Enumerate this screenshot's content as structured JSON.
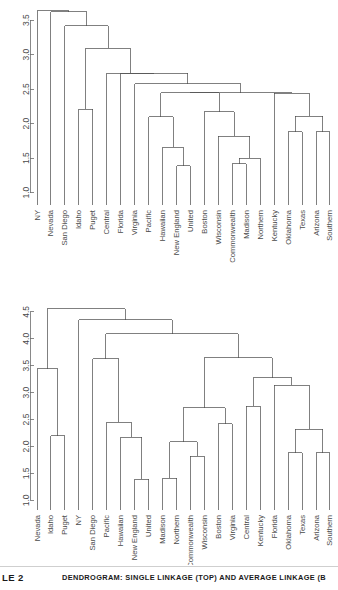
{
  "figure": {
    "caption_number": "LE 2",
    "caption_text": "DENDROGRAM: SINGLE LINKAGE (TOP) AND AVERAGE LINKAGE (B",
    "line_color": "#4a4a4a",
    "axis_color": "#6b6b6b",
    "background": "#ffffff"
  },
  "chart_data": [
    {
      "type": "dendrogram",
      "title": "Single linkage (top panel)",
      "xlabel": "",
      "ylabel": "",
      "ylim": [
        0.82,
        3.72
      ],
      "yticks": [
        1.0,
        1.5,
        2.0,
        2.5,
        3.0,
        3.5
      ],
      "ytick_labels": [
        "1.0",
        "1.5",
        "2.0",
        "2.5",
        "3.0",
        "3.5"
      ],
      "grid": false,
      "legend": "none",
      "leaves": [
        "NY",
        "Nevada",
        "San Diego",
        "Idaho",
        "Puget",
        "Central",
        "Florida",
        "Virginia",
        "Pacific",
        "Hawaiian",
        "New England",
        "United",
        "Boston",
        "Wisconsin",
        "Commonwealth",
        "Madison",
        "Northern",
        "Kentucky",
        "Oklahoma",
        "Texas",
        "Arizona",
        "Southern"
      ],
      "merges": [
        {
          "id": "m1",
          "left": "New England",
          "right": "United",
          "height": 1.39
        },
        {
          "id": "m2",
          "left": "Commonwealth",
          "right": "Madison",
          "height": 1.42
        },
        {
          "id": "m3",
          "left": "m2",
          "right": "Northern",
          "height": 1.5
        },
        {
          "id": "m4",
          "left": "Hawaiian",
          "right": "m1",
          "height": 1.66
        },
        {
          "id": "m5",
          "left": "Wisconsin",
          "right": "m3",
          "height": 1.82
        },
        {
          "id": "m6",
          "left": "Oklahoma",
          "right": "Texas",
          "height": 1.88
        },
        {
          "id": "m7",
          "left": "Arizona",
          "right": "Southern",
          "height": 1.88
        },
        {
          "id": "m8",
          "left": "Pacific",
          "right": "m4",
          "height": 2.1
        },
        {
          "id": "m9",
          "left": "m6",
          "right": "m7",
          "height": 2.11
        },
        {
          "id": "m10",
          "left": "Boston",
          "right": "m5",
          "height": 2.17
        },
        {
          "id": "m11",
          "left": "Idaho",
          "right": "Puget",
          "height": 2.21
        },
        {
          "id": "m12",
          "left": "Kentucky",
          "right": "m9",
          "height": 2.44
        },
        {
          "id": "m13",
          "left": "m8",
          "right": "m10",
          "height": 2.45
        },
        {
          "id": "m14",
          "left": "m13",
          "right": "m12",
          "height": 2.45
        },
        {
          "id": "m15",
          "left": "Virginia",
          "right": "m14",
          "height": 2.58
        },
        {
          "id": "m16",
          "left": "Florida",
          "right": "m15",
          "height": 2.73
        },
        {
          "id": "m17",
          "left": "Central",
          "right": "m16",
          "height": 2.73
        },
        {
          "id": "m18",
          "left": "m11",
          "right": "m17",
          "height": 3.09
        },
        {
          "id": "m19",
          "left": "San Diego",
          "right": "m18",
          "height": 3.42
        },
        {
          "id": "m20",
          "left": "Nevada",
          "right": "m19",
          "height": 3.62
        },
        {
          "id": "m21",
          "left": "NY",
          "right": "m20",
          "height": 3.64
        }
      ]
    },
    {
      "type": "dendrogram",
      "title": "Average linkage (bottom panel)",
      "xlabel": "",
      "ylabel": "",
      "ylim": [
        0.82,
        4.72
      ],
      "yticks": [
        1.0,
        1.5,
        2.0,
        2.5,
        3.0,
        3.5,
        4.0,
        4.5
      ],
      "ytick_labels": [
        "1.0",
        "1.5",
        "2.0",
        "2.5",
        "3.0",
        "3.5",
        "4.0",
        "4.5"
      ],
      "grid": false,
      "legend": "none",
      "leaves": [
        "Nevada",
        "Idaho",
        "Puget",
        "NY",
        "San Diego",
        "Pacific",
        "Hawaiian",
        "New England",
        "United",
        "Madison",
        "Northern",
        "Commonwealth",
        "Wisconsin",
        "Boston",
        "Virginia",
        "Central",
        "Kentucky",
        "Florida",
        "Oklahoma",
        "Texas",
        "Arizona",
        "Southern"
      ],
      "merges": [
        {
          "id": "b1",
          "left": "New England",
          "right": "United",
          "height": 1.39
        },
        {
          "id": "b2",
          "left": "Madison",
          "right": "Northern",
          "height": 1.41
        },
        {
          "id": "b3",
          "left": "Oklahoma",
          "right": "Texas",
          "height": 1.88
        },
        {
          "id": "b4",
          "left": "Arizona",
          "right": "Southern",
          "height": 1.88
        },
        {
          "id": "b5",
          "left": "Commonwealth",
          "right": "Wisconsin",
          "height": 1.82
        },
        {
          "id": "b6",
          "left": "Hawaiian",
          "right": "b1",
          "height": 2.17
        },
        {
          "id": "b7",
          "left": "Idaho",
          "right": "Puget",
          "height": 2.2
        },
        {
          "id": "b8",
          "left": "b2",
          "right": "b5",
          "height": 2.09
        },
        {
          "id": "b9",
          "left": "b3",
          "right": "b4",
          "height": 2.32
        },
        {
          "id": "b10",
          "left": "Boston",
          "right": "Virginia",
          "height": 2.42
        },
        {
          "id": "b11",
          "left": "Pacific",
          "right": "b6",
          "height": 2.45
        },
        {
          "id": "b12",
          "left": "b8",
          "right": "b10",
          "height": 2.72
        },
        {
          "id": "b13",
          "left": "Central",
          "right": "Kentucky",
          "height": 2.75
        },
        {
          "id": "b14",
          "left": "Florida",
          "right": "b9",
          "height": 3.14
        },
        {
          "id": "b15",
          "left": "b13",
          "right": "b14",
          "height": 3.28
        },
        {
          "id": "b16",
          "left": "Nevada",
          "right": "b7",
          "height": 3.44
        },
        {
          "id": "b17",
          "left": "San Diego",
          "right": "b11",
          "height": 3.63
        },
        {
          "id": "b18",
          "left": "b12",
          "right": "b15",
          "height": 3.65
        },
        {
          "id": "b19",
          "left": "b17",
          "right": "b18",
          "height": 4.09
        },
        {
          "id": "b20",
          "left": "NY",
          "right": "b19",
          "height": 4.35
        },
        {
          "id": "b21",
          "left": "b16",
          "right": "b20",
          "height": 4.56
        }
      ]
    }
  ]
}
